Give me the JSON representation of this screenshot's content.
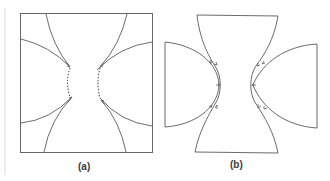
{
  "figure": {
    "panels": [
      {
        "id": "a",
        "label": "(a)",
        "description": "Square domain with four curved arcs converging toward the center, dotted arcs connecting tips"
      },
      {
        "id": "b",
        "label": "(b)",
        "description": "Hourglass-shaped domain with two half-disc regions on either side, double arcs with arrow markers"
      }
    ],
    "colors": {
      "stroke": "#555555",
      "frame": "#6a6a6a",
      "faint_line": "#d8d8d8",
      "background": "#ffffff"
    }
  }
}
